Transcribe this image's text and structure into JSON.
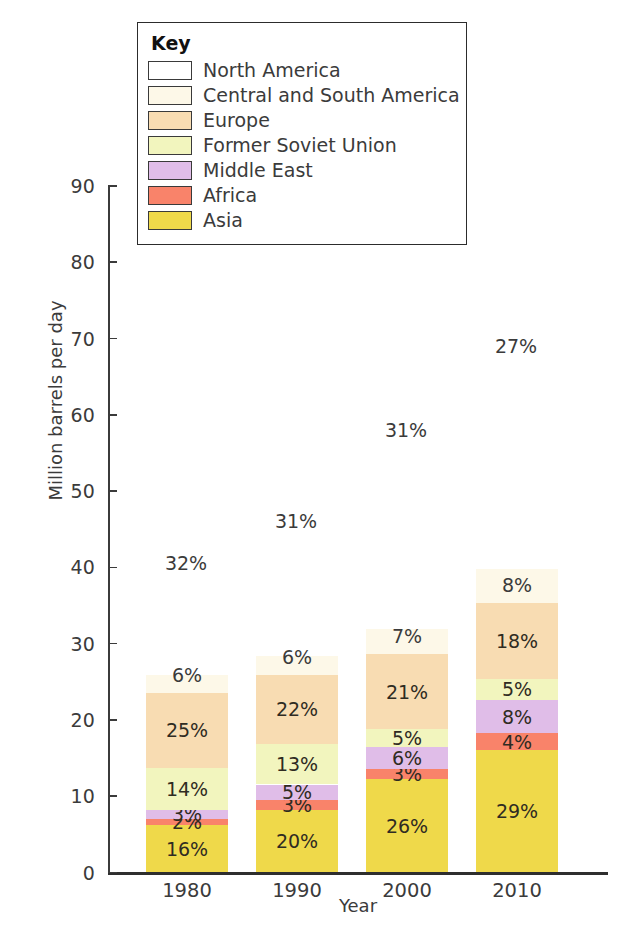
{
  "chart_data": {
    "type": "bar",
    "subtype": "stacked-bar",
    "title": "",
    "xlabel": "Year",
    "ylabel": "Million barrels per day",
    "categories": [
      "1980",
      "1990",
      "2000",
      "2010"
    ],
    "ylim": [
      0,
      90
    ],
    "yticks": [
      0,
      10,
      20,
      30,
      40,
      50,
      60,
      70,
      80,
      90
    ],
    "grid": false,
    "legend_position": "inside-top-left",
    "legend_title": "Key",
    "value_unit": "%",
    "stack_order_bottom_to_top": [
      "Asia",
      "Africa",
      "Middle East",
      "Former Soviet Union",
      "Europe",
      "Central and South America",
      "North America"
    ],
    "series": [
      {
        "name": "Asia",
        "color": "#EFD94A",
        "values": [
          16,
          20,
          26,
          29
        ],
        "labels": [
          "16%",
          "20%",
          "26%",
          "29%"
        ]
      },
      {
        "name": "Africa",
        "color": "#F9836A",
        "values": [
          2,
          3,
          3,
          4
        ],
        "labels": [
          "2%",
          "3%",
          "3%",
          "4%"
        ]
      },
      {
        "name": "Middle East",
        "color": "#E0BDE8",
        "values": [
          3,
          5,
          6,
          8
        ],
        "labels": [
          "3%",
          "5%",
          "6%",
          "8%"
        ]
      },
      {
        "name": "Former Soviet Union",
        "color": "#F2F5BE",
        "values": [
          14,
          13,
          5,
          5
        ],
        "labels": [
          "14%",
          "13%",
          "5%",
          "5%"
        ]
      },
      {
        "name": "Europe",
        "color": "#F8DCB2",
        "values": [
          25,
          22,
          21,
          18
        ],
        "labels": [
          "25%",
          "22%",
          "21%",
          "18%"
        ]
      },
      {
        "name": "Central and South America",
        "color": "#FDF8E8",
        "values": [
          6,
          6,
          7,
          8
        ],
        "labels": [
          "6%",
          "6%",
          "7%",
          "8%"
        ]
      },
      {
        "name": "North America",
        "color": "#FFFFFF",
        "values": [
          32,
          31,
          31,
          27
        ],
        "labels": [
          "32%",
          "31%",
          "31%",
          "27%"
        ]
      }
    ],
    "bar_totals_million_bbl_per_day": [
      38.5,
      41.2,
      46.5,
      54.7
    ]
  },
  "legend": {
    "title": "Key",
    "items": [
      {
        "label": "North America",
        "color": "#FFFFFF"
      },
      {
        "label": "Central and South America",
        "color": "#FDF8E8"
      },
      {
        "label": "Europe",
        "color": "#F8DCB2"
      },
      {
        "label": "Former Soviet Union",
        "color": "#F2F5BE"
      },
      {
        "label": "Middle East",
        "color": "#E0BDE8"
      },
      {
        "label": "Africa",
        "color": "#F9836A"
      },
      {
        "label": "Asia",
        "color": "#EFD94A"
      }
    ]
  },
  "axes": {
    "y_title": "Million barrels per day",
    "x_title": "Year",
    "y_tick_labels": [
      "90",
      "80",
      "70",
      "60",
      "50",
      "40",
      "30",
      "20",
      "10",
      "0"
    ],
    "x_tick_labels": [
      "1980",
      "1990",
      "2000",
      "2010"
    ]
  }
}
